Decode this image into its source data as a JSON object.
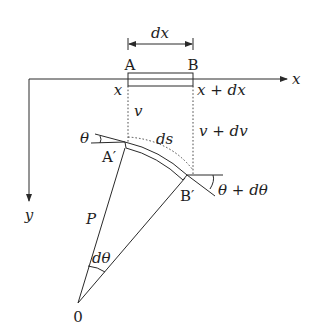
{
  "diagram": {
    "type": "beam-deflection-element",
    "labels": {
      "dx": "dx",
      "point_a": "A",
      "point_b": "B",
      "x_at_a": "x",
      "x_at_b": "x + dx",
      "x_axis": "x",
      "y_axis": "y",
      "v": "v",
      "v_plus_dv": "v + dv",
      "ds": "ds",
      "theta": "θ",
      "point_a_prime": "A′",
      "point_b_prime": "B′",
      "theta_plus_dtheta": "θ + dθ",
      "radius": "P",
      "dtheta": "dθ",
      "origin": "0"
    },
    "colors": {
      "line": "#2a2a2a",
      "text": "#1e1e1e",
      "background": "#ffffff"
    }
  }
}
